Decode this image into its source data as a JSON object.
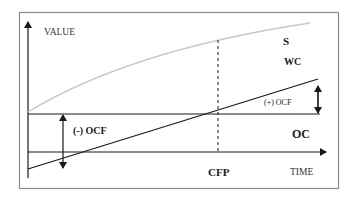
{
  "diagram": {
    "axes": {
      "y_label": "VALUE",
      "x_label": "TIME"
    },
    "curves": {
      "s_label": "S",
      "wc_label": "WC",
      "oc_label": "OC"
    },
    "annotations": {
      "positive_ocf": "(+) OCF",
      "negative_ocf": "(-) OCF",
      "cfp_label": "CFP"
    },
    "colors": {
      "frame": "#8a8a8a",
      "lines": "#1a1a1a",
      "s_curve": "#c8c8c8"
    }
  }
}
